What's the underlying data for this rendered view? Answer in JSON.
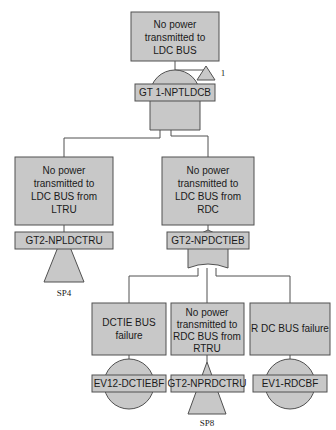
{
  "diagram": {
    "type": "fault-tree",
    "top_event": {
      "text": [
        "No power",
        "transmitted to",
        "LDC BUS"
      ],
      "gate_type": "AND",
      "gate_label": "GT 1-NPTLDCB",
      "transfer_marker": "1"
    },
    "level2": [
      {
        "text": [
          "No power",
          "transmitted to",
          "LDC BUS from",
          "LTRU"
        ],
        "gate_type": "transfer",
        "gate_label": "GT2-NPLDCTRU",
        "transfer_ref": "SP4"
      },
      {
        "text": [
          "No power",
          "transmitted to",
          "LDC BUS from",
          "RDC"
        ],
        "gate_type": "OR",
        "gate_label": "GT2-NPDCTIEB"
      }
    ],
    "level3": [
      {
        "text": [
          "DCTIE BUS",
          "failure"
        ],
        "gate_type": "basic-event",
        "gate_label": "EV12-DCTIEBF"
      },
      {
        "text": [
          "No power",
          "transmitted to",
          "RDC BUS from",
          "RTRU"
        ],
        "gate_type": "transfer",
        "gate_label": "GT2-NPRDCTRU",
        "transfer_ref": "SP8"
      },
      {
        "text": [
          "R DC BUS failure"
        ],
        "gate_type": "basic-event",
        "gate_label": "EV1-RDCBF"
      }
    ]
  }
}
